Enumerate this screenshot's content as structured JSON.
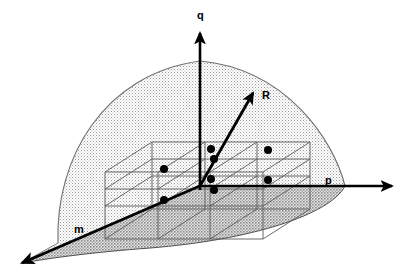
{
  "figure": {
    "type": "3d-geometric-diagram",
    "title": "",
    "background_color": "#ffffff",
    "width": 400,
    "height": 277
  },
  "axes": [
    {
      "id": "q",
      "label": "q",
      "label_x": 197,
      "label_y": 19,
      "description": "vertical axis pointing up",
      "from": [
        200,
        186
      ],
      "to": [
        200,
        33
      ],
      "arrow": true
    },
    {
      "id": "p",
      "label": "p",
      "label_x": 325,
      "label_y": 184,
      "description": "horizontal axis pointing right",
      "from": [
        200,
        186
      ],
      "to": [
        392,
        186
      ],
      "arrow": true
    },
    {
      "id": "m",
      "label": "m",
      "label_x": 74,
      "label_y": 233,
      "description": "oblique axis pointing down-left",
      "from": [
        200,
        186
      ],
      "to": [
        22,
        263
      ],
      "arrow": true
    }
  ],
  "vectors": [
    {
      "id": "R",
      "label": "R",
      "label_x": 262,
      "label_y": 99,
      "description": "resultant vector arrow from origin up-right",
      "from": [
        200,
        186
      ],
      "to": [
        253,
        93
      ],
      "arrow": true
    }
  ],
  "regions": [
    {
      "id": "dome",
      "name": "upper-dome-region",
      "fill": "#e9e9e9",
      "stroke": "#6b6b6b",
      "description": "light stippled dome / paraboloid surface above the base plane"
    },
    {
      "id": "base-plane",
      "name": "base-shaded-plane",
      "fill": "#c9c9c9",
      "stroke": "#4a4a4a",
      "description": "darker stippled ground plane wedge below the m-axis"
    }
  ],
  "lattice": {
    "name": "grid-box-lattice",
    "stroke": "#5a5a5a",
    "description": "wireframe box made of two stacked layers of parallelepiped cells",
    "layers": 2,
    "columns": 3,
    "rows": 2
  },
  "points": {
    "name": "lattice-points",
    "color": "#000000",
    "radius": 4,
    "count": 8,
    "coordinates": [
      [
        164,
        169
      ],
      [
        164,
        200
      ],
      [
        211,
        149
      ],
      [
        211,
        179
      ],
      [
        214,
        159
      ],
      [
        214,
        190
      ],
      [
        268,
        150
      ],
      [
        268,
        180
      ]
    ]
  },
  "colors": {
    "ink": "#000000",
    "dome_fill": "#e9e9e9",
    "base_fill": "#c9c9c9",
    "grid_stroke": "#5a5a5a",
    "outline": "#6b6b6b"
  }
}
